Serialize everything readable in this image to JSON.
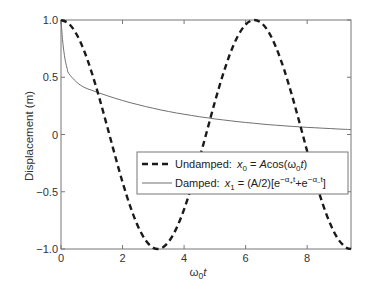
{
  "chart_data": {
    "type": "line",
    "title": "",
    "xlabel": "ω0t",
    "xlabel_parts": {
      "main": "ω",
      "sub": "0",
      "italic": "t"
    },
    "ylabel": "Displacement (m)",
    "xlim": [
      0,
      9.4248
    ],
    "ylim": [
      -1.0,
      1.0
    ],
    "grid": false,
    "legend_position": "center-right",
    "x_ticks": [
      0,
      2,
      4,
      6,
      8
    ],
    "x_tick_labels": [
      "0",
      "2",
      "4",
      "6",
      "8"
    ],
    "y_ticks": [
      1.0,
      0.5,
      0,
      -0.5,
      -1.0
    ],
    "y_tick_labels": [
      "1.0",
      "0.5",
      "0",
      "−0.5",
      "−1.0"
    ],
    "x": [
      0,
      0.25,
      0.5,
      0.75,
      1.0,
      1.25,
      1.5,
      1.75,
      2.0,
      2.25,
      2.5,
      2.75,
      3.0,
      3.25,
      3.5,
      3.75,
      4.0,
      4.25,
      4.5,
      4.75,
      5.0,
      5.25,
      5.5,
      5.75,
      6.0,
      6.25,
      6.5,
      6.75,
      7.0,
      7.25,
      7.5,
      7.75,
      8.0,
      8.25,
      8.5,
      8.75,
      9.0,
      9.25,
      9.4248
    ],
    "series": [
      {
        "name": "Undamped: x0 = Acos(ω0t)",
        "style": "dashed",
        "color": "#1a1a1a",
        "values": [
          1.0,
          0.969,
          0.878,
          0.732,
          0.54,
          0.315,
          0.071,
          -0.178,
          -0.416,
          -0.628,
          -0.801,
          -0.924,
          -0.99,
          -0.994,
          -0.936,
          -0.82,
          -0.654,
          -0.446,
          -0.211,
          0.037,
          0.284,
          0.512,
          0.709,
          0.861,
          0.96,
          0.999,
          0.977,
          0.894,
          0.754,
          0.568,
          0.347,
          0.105,
          -0.146,
          -0.386,
          -0.602,
          -0.78,
          -0.911,
          -0.985,
          -1.0
        ]
      },
      {
        "name": "Damped: x1 = (A/2)[e^(−α+t)+e^(−α−t)]",
        "style": "solid",
        "color": "#707070",
        "values": [
          1.0,
          0.534,
          0.459,
          0.412,
          0.386,
          0.362,
          0.339,
          0.317,
          0.297,
          0.278,
          0.261,
          0.244,
          0.229,
          0.214,
          0.201,
          0.188,
          0.177,
          0.166,
          0.155,
          0.146,
          0.136,
          0.128,
          0.12,
          0.112,
          0.105,
          0.099,
          0.092,
          0.086,
          0.081,
          0.076,
          0.071,
          0.067,
          0.062,
          0.059,
          0.055,
          0.052,
          0.048,
          0.045,
          0.043
        ]
      }
    ],
    "legend": [
      {
        "label_prefix": "Undamped:",
        "formula_var": "x",
        "formula_sub": "0",
        "formula_rest_1": " = ",
        "formula_A": "A",
        "formula_rest_2": "cos(ω",
        "formula_sub2": "0",
        "formula_t": "t",
        "formula_close": ")"
      },
      {
        "label_prefix": "Damped:",
        "formula_var": "x",
        "formula_sub": "1",
        "formula_rest": " = (A/2)[e",
        "exp1": "−α",
        "exp1_sub": "+",
        "exp1_t": "t",
        "plus": "+e",
        "exp2": "−α",
        "exp2_sub": "−",
        "exp2_t": "t",
        "close": "]"
      }
    ]
  },
  "colors": {
    "axis": "#555555",
    "undamped": "#1a1a1a",
    "damped": "#707070",
    "legend_border": "#777777"
  }
}
